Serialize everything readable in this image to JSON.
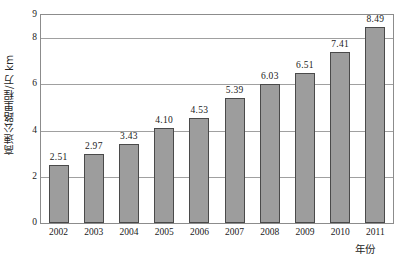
{
  "chart_data": {
    "type": "bar",
    "title": "",
    "xlabel": "年份",
    "ylabel": "高速公路里程/万 km",
    "categories": [
      "2002",
      "2003",
      "2004",
      "2005",
      "2006",
      "2007",
      "2008",
      "2009",
      "2010",
      "2011"
    ],
    "values": [
      2.51,
      2.97,
      3.43,
      4.1,
      4.53,
      5.39,
      6.03,
      6.51,
      7.41,
      8.49
    ],
    "value_labels": [
      "2.51",
      "2.97",
      "3.43",
      "4.10",
      "4.53",
      "5.39",
      "6.03",
      "6.51",
      "7.41",
      "8.49"
    ],
    "ylim": [
      0,
      9
    ],
    "y_ticks": [
      0,
      2,
      4,
      6,
      8,
      9
    ],
    "y_tick_labels": [
      "0",
      "2",
      "4",
      "6",
      "8",
      "9"
    ],
    "gridlines": [
      2,
      4,
      6,
      8
    ],
    "grid": true,
    "legend": "none",
    "bar_color": "#9d9d9d",
    "bar_border_color": "#4a4a4a",
    "axis_color": "#8c8c8c",
    "grid_color": "#a0a0a0",
    "text_color": "#1a1a1a"
  }
}
